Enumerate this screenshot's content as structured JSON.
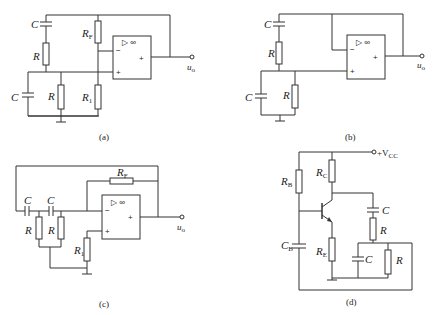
{
  "figure": {
    "panels": [
      {
        "id": "a",
        "caption": "(a)",
        "labels": {
          "C1": "C",
          "R1": "R",
          "C2": "C",
          "R2": "R",
          "RF": "R",
          "RF_sub": "F",
          "R1b": "R",
          "R1b_sub": "1",
          "out": "u",
          "out_sub": "o"
        },
        "opamp": {
          "symbol": "▷ ∞",
          "minus": "−",
          "plus": "+",
          "out_plus": "+"
        }
      },
      {
        "id": "b",
        "caption": "(b)",
        "labels": {
          "C1": "C",
          "R1": "R",
          "C2": "C",
          "R2": "R",
          "out": "u",
          "out_sub": "o"
        },
        "opamp": {
          "symbol": "▷ ∞",
          "minus": "−",
          "plus": "+",
          "out_plus": "+"
        }
      },
      {
        "id": "c",
        "caption": "(c)",
        "labels": {
          "C1": "C",
          "C2": "C",
          "Ra": "R",
          "Rb": "R",
          "RF": "R",
          "RF_sub": "F",
          "R1": "R",
          "R1_sub": "1",
          "out": "u",
          "out_sub": "o"
        },
        "opamp": {
          "symbol": "▷ ∞",
          "minus": "−",
          "plus": "+",
          "out_plus": "+"
        }
      },
      {
        "id": "d",
        "caption": "(d)",
        "labels": {
          "vcc": "+V",
          "vcc_sub": "CC",
          "RB": "R",
          "RB_sub": "B",
          "RC": "R",
          "RC_sub": "C",
          "RE": "R",
          "RE_sub": "E",
          "CB": "C",
          "CB_sub": "B",
          "C1": "C",
          "R1": "R",
          "C2": "C",
          "R2": "R"
        }
      }
    ]
  }
}
